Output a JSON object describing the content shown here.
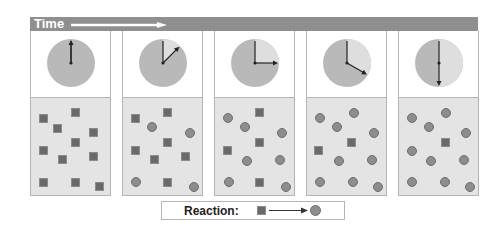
{
  "header": {
    "title": "Time",
    "bar_color": "#8f8f8f"
  },
  "legend": {
    "label": "Reaction:",
    "reactant": "square",
    "product": "circle"
  },
  "colors": {
    "clock_filled": "#b9b9b9",
    "clock_remaining": "#dedede",
    "box_bg": "#e4e4e4",
    "square": "#6a6a6a",
    "circle": "#8d8d8d"
  },
  "panels": [
    {
      "clock_angle_deg": 0,
      "squares": [
        [
          8,
          16
        ],
        [
          40,
          10
        ],
        [
          22,
          26
        ],
        [
          58,
          30
        ],
        [
          40,
          40
        ],
        [
          8,
          48
        ],
        [
          27,
          57
        ],
        [
          58,
          54
        ],
        [
          8,
          80
        ],
        [
          40,
          80
        ],
        [
          64,
          84
        ]
      ],
      "circles": []
    },
    {
      "clock_angle_deg": 45,
      "squares": [
        [
          8,
          16
        ],
        [
          40,
          10
        ],
        [
          40,
          40
        ],
        [
          8,
          48
        ],
        [
          27,
          57
        ],
        [
          58,
          54
        ],
        [
          40,
          80
        ]
      ],
      "circles": [
        [
          24,
          24
        ],
        [
          62,
          30
        ],
        [
          8,
          79
        ],
        [
          66,
          84
        ]
      ]
    },
    {
      "clock_angle_deg": 90,
      "squares": [
        [
          40,
          10
        ],
        [
          40,
          40
        ],
        [
          8,
          48
        ],
        [
          40,
          80
        ]
      ],
      "circles": [
        [
          8,
          15
        ],
        [
          25,
          24
        ],
        [
          62,
          30
        ],
        [
          27,
          58
        ],
        [
          60,
          57
        ],
        [
          9,
          79
        ],
        [
          66,
          84
        ]
      ]
    },
    {
      "clock_angle_deg": 120,
      "squares": [
        [
          40,
          40
        ],
        [
          7,
          48
        ]
      ],
      "circles": [
        [
          8,
          15
        ],
        [
          42,
          10
        ],
        [
          25,
          24
        ],
        [
          62,
          30
        ],
        [
          27,
          58
        ],
        [
          60,
          57
        ],
        [
          8,
          79
        ],
        [
          41,
          79
        ],
        [
          66,
          84
        ]
      ]
    },
    {
      "clock_angle_deg": 180,
      "squares": [
        [
          42,
          40
        ]
      ],
      "circles": [
        [
          8,
          15
        ],
        [
          42,
          10
        ],
        [
          25,
          24
        ],
        [
          62,
          30
        ],
        [
          8,
          48
        ],
        [
          27,
          58
        ],
        [
          60,
          57
        ],
        [
          8,
          79
        ],
        [
          41,
          79
        ],
        [
          66,
          84
        ]
      ]
    }
  ]
}
